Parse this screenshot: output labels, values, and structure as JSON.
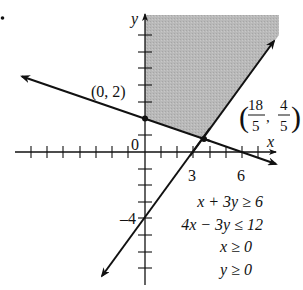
{
  "figure": {
    "type": "linear-programming-feasible-region",
    "bullet": "•",
    "axes": {
      "x_label": "x",
      "y_label": "y",
      "origin_label": "0",
      "x_tick_labels": [
        {
          "value": 3,
          "text": "3"
        },
        {
          "value": 6,
          "text": "6"
        }
      ],
      "y_tick_labels": [
        {
          "value": -4,
          "text": "–4"
        }
      ],
      "x_range": [
        -8,
        8
      ],
      "y_range": [
        -8,
        8
      ]
    },
    "lines": [
      {
        "equation": "x + 3y = 6",
        "style": "solid",
        "arrows": "both"
      },
      {
        "equation": "4x − 3y = 12",
        "style": "solid",
        "arrows": "both"
      }
    ],
    "points": [
      {
        "label": "(0, 2)",
        "x": 0,
        "y": 2
      },
      {
        "label": "(18/5, 4/5)",
        "x": 3.6,
        "y": 0.8,
        "num_x": "18",
        "den_x": "5",
        "num_y": "4",
        "den_y": "5"
      }
    ],
    "shaded_region": {
      "description": "feasible region bounded by y-axis, x + 3y ≥ 6 and 4x − 3y ≤ 12, unbounded upward",
      "color": "#b8b8b8"
    },
    "constraints": [
      "x + 3y ≥ 6",
      "4x − 3y ≤ 12",
      "x ≥ 0",
      "y ≥ 0"
    ],
    "labels": {
      "point_a": "(0, 2)",
      "point_b_open": "(",
      "point_b_close": ")",
      "point_b_comma": ",",
      "point_b_num_x": "18",
      "point_b_den_x": "5",
      "point_b_num_y": "4",
      "point_b_den_y": "5"
    }
  }
}
